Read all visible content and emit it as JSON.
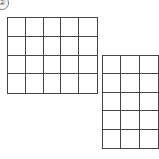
{
  "label": "②",
  "grids": [
    {
      "name": "left-grid",
      "columns": 5,
      "rows": 4
    },
    {
      "name": "right-grid",
      "columns": 3,
      "rows": 5
    }
  ],
  "colors": {
    "line": "#444444",
    "background": "#ffffff"
  }
}
